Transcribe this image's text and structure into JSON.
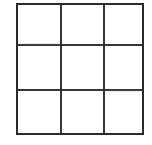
{
  "figure": {
    "kind": "grid-figure",
    "background_color": "#ffffff",
    "line_color": "#2b2b2b",
    "line_width_px": 2,
    "rows": 3,
    "columns": 3,
    "bounds": {
      "x": 16,
      "y": 3,
      "width": 128,
      "height": 132
    },
    "vertical_line_x": [
      16,
      61,
      104,
      144
    ],
    "horizontal_line_y": [
      3,
      45,
      90,
      135
    ],
    "cells": [
      {
        "id": "r1c1",
        "label": "",
        "row": 1,
        "column": 1
      },
      {
        "id": "r1c2",
        "label": "",
        "row": 1,
        "column": 2
      },
      {
        "id": "r1c3",
        "label": "",
        "row": 1,
        "column": 3
      },
      {
        "id": "r2c1",
        "label": "",
        "row": 2,
        "column": 1
      },
      {
        "id": "r2c2",
        "label": "",
        "row": 2,
        "column": 2
      },
      {
        "id": "r2c3",
        "label": "",
        "row": 2,
        "column": 3
      },
      {
        "id": "r3c1",
        "label": "",
        "row": 3,
        "column": 1
      },
      {
        "id": "r3c2",
        "label": "",
        "row": 3,
        "column": 2
      },
      {
        "id": "r3c3",
        "label": "",
        "row": 3,
        "column": 3
      }
    ]
  }
}
